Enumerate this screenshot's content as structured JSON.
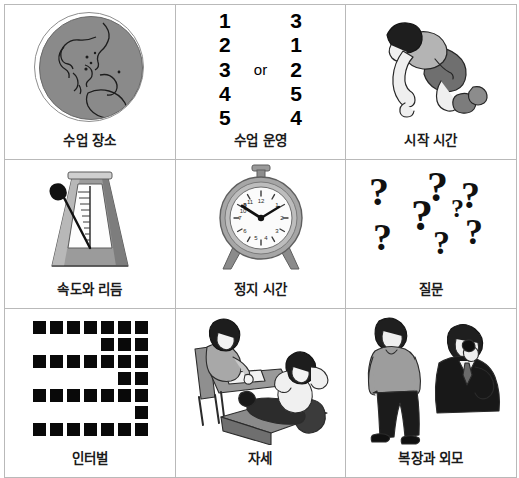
{
  "page": {
    "layout": "3x3 grid",
    "border_color": "#b9b9b9",
    "background": "#ffffff",
    "text_color": "#1b1b1b"
  },
  "cells": [
    {
      "id": "cell-lesson-place",
      "caption": "수업 장소",
      "icon": "globe-icon",
      "illustration": "globe showing Asia and Australia, gray sphere with thin outer ring"
    },
    {
      "id": "cell-lesson-operation",
      "caption": "수업 운영",
      "icon": "ordered-list-icon",
      "left_sequence": [
        "1",
        "2",
        "3",
        "4",
        "5"
      ],
      "conjunction": "or",
      "right_sequence": [
        "3",
        "1",
        "2",
        "5",
        "4"
      ]
    },
    {
      "id": "cell-start-time",
      "caption": "시작 시간",
      "icon": "crouching-runner-icon",
      "illustration": "person crouched in a sprint start position"
    },
    {
      "id": "cell-tempo-rhythm",
      "caption": "속도와 리듬",
      "icon": "metronome-icon",
      "illustration": "mechanical metronome with swinging pendulum arm"
    },
    {
      "id": "cell-stop-time",
      "caption": "정지 시간",
      "icon": "alarm-clock-icon",
      "illustration": "round alarm clock on two legs with a top bell knob",
      "clock_time": "10:05"
    },
    {
      "id": "cell-questions",
      "caption": "질문",
      "icon": "question-mark-icon",
      "question_marks": [
        "?",
        "?",
        "?",
        "?",
        "?",
        "?",
        "?"
      ],
      "illustration": "seven scattered question marks of varying sizes"
    },
    {
      "id": "cell-interval",
      "caption": "인터벌",
      "icon": "interval-grid-icon",
      "grid_columns": 7,
      "grid_rows": [
        [
          1,
          1,
          1,
          1,
          1,
          1,
          1
        ],
        [
          0,
          0,
          0,
          0,
          1,
          1,
          1
        ],
        [
          1,
          1,
          1,
          1,
          1,
          1,
          1
        ],
        [
          0,
          0,
          0,
          0,
          0,
          1,
          1
        ],
        [
          1,
          1,
          1,
          1,
          1,
          1,
          1
        ],
        [
          0,
          0,
          0,
          0,
          0,
          0,
          1
        ],
        [
          1,
          1,
          1,
          1,
          1,
          1,
          1
        ]
      ],
      "illustration": "serpentine pattern of filled black squares"
    },
    {
      "id": "cell-posture",
      "caption": "자세",
      "icon": "posture-icon",
      "illustration": "one person sitting at a desk writing, another reclining with feet up on a table"
    },
    {
      "id": "cell-attire-appearance",
      "caption": "복장과 외모",
      "icon": "attire-icon",
      "illustration": "a man in casual clothes standing, and a man in a dark suit talking on a phone"
    }
  ]
}
